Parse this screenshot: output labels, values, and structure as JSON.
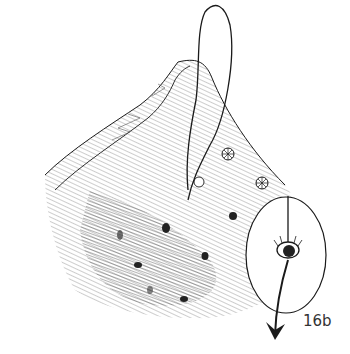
{
  "figure": {
    "label": "16b",
    "colors": {
      "ink": "#1a1a1a",
      "hatch": "#555555",
      "background": "#ffffff",
      "label": "#333333"
    }
  }
}
